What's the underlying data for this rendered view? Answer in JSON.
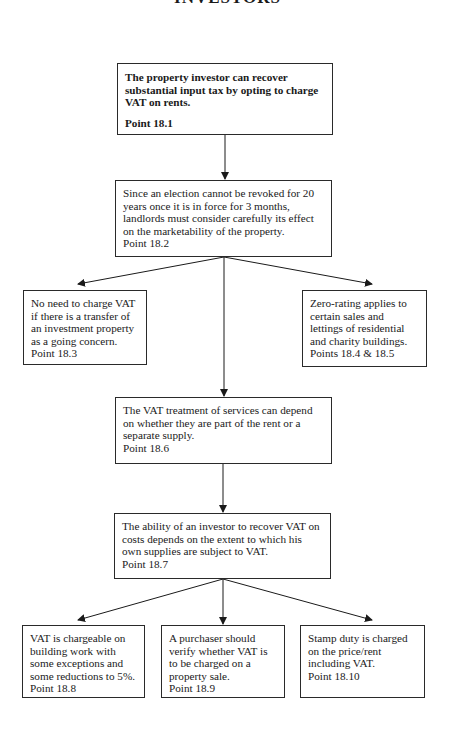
{
  "page_title": "INVESTORS",
  "nodes": {
    "n1": {
      "text": "The property investor can recover substantial input tax by opting to charge VAT on rents.",
      "ref": "Point 18.1"
    },
    "n2": {
      "text": "Since an election cannot be revoked for 20 years once it is in force for 3 months, landlords must consider carefully its effect on the marketability of the property.",
      "ref": "Point 18.2"
    },
    "n3": {
      "text": "No need to charge VAT if there is a transfer of an investment property as a going concern.",
      "ref": "Point 18.3"
    },
    "n4": {
      "text": "Zero-rating applies to certain sales and lettings of residential and charity buildings.",
      "ref": "Points 18.4 & 18.5"
    },
    "n5": {
      "text": "The VAT treatment of services can depend on whether they are part of the rent or a separate supply.",
      "ref": "Point 18.6"
    },
    "n6": {
      "text": "The ability of an investor to recover VAT on costs depends on the extent to which his own supplies are subject to VAT.",
      "ref": "Point 18.7"
    },
    "n7": {
      "text": "VAT is chargeable on building work with some exceptions and some reductions to 5%.",
      "ref": "Point 18.8"
    },
    "n8": {
      "text": "A purchaser should verify whether VAT is to be charged on a property sale.",
      "ref": "Point 18.9"
    },
    "n9": {
      "text": "Stamp duty is charged on the price/rent including VAT.",
      "ref": "Point 18.10"
    }
  },
  "edges": [
    {
      "from": "n1",
      "to": "n2"
    },
    {
      "from": "n2",
      "to": "n3"
    },
    {
      "from": "n2",
      "to": "n4"
    },
    {
      "from": "n2",
      "to": "n5"
    },
    {
      "from": "n5",
      "to": "n6"
    },
    {
      "from": "n6",
      "to": "n7"
    },
    {
      "from": "n6",
      "to": "n8"
    },
    {
      "from": "n6",
      "to": "n9"
    }
  ]
}
